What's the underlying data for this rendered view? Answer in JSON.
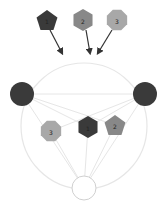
{
  "diagram": {
    "colors": {
      "dark": "#3a3a3a",
      "mid": "#888888",
      "light": "#a8a8a8",
      "edge": "#e6e6e6",
      "arrow": "#333333",
      "outline": "#d0d0d0"
    },
    "top_nodes": [
      {
        "id": "top-1",
        "shape": "pentagon",
        "label": "1",
        "cx": 47,
        "cy": 20,
        "color": "#3a3a3a"
      },
      {
        "id": "top-2",
        "shape": "hexagon",
        "label": "2",
        "cx": 83,
        "cy": 20,
        "color": "#888888"
      },
      {
        "id": "top-3",
        "shape": "octagon",
        "label": "3",
        "cx": 117,
        "cy": 20,
        "color": "#a8a8a8"
      }
    ],
    "arrows": [
      {
        "from": "top-1",
        "x1": 50,
        "y1": 30,
        "x2": 62,
        "y2": 53
      },
      {
        "from": "top-2",
        "x1": 86,
        "y1": 30,
        "x2": 90,
        "y2": 53
      },
      {
        "from": "top-3",
        "x1": 112,
        "y1": 30,
        "x2": 98,
        "y2": 53
      }
    ],
    "big_circle": {
      "cx": 84,
      "cy": 126,
      "r": 63
    },
    "side_nodes": [
      {
        "id": "left",
        "shape": "circle",
        "cx": 22,
        "cy": 94,
        "r": 12,
        "color": "#3a3a3a"
      },
      {
        "id": "right",
        "shape": "circle",
        "cx": 145,
        "cy": 94,
        "r": 12,
        "color": "#3a3a3a"
      }
    ],
    "inner_nodes": [
      {
        "id": "inner-3",
        "shape": "octagon",
        "label": "3",
        "cx": 51,
        "cy": 131,
        "color": "#a8a8a8"
      },
      {
        "id": "inner-1",
        "shape": "hexagon",
        "label": "1",
        "cx": 88,
        "cy": 127,
        "color": "#3a3a3a"
      },
      {
        "id": "inner-2",
        "shape": "pentagon",
        "label": "2",
        "cx": 115,
        "cy": 125,
        "color": "#888888"
      }
    ],
    "bottom_node": {
      "id": "bottom",
      "shape": "circle",
      "cx": 84,
      "cy": 188,
      "r": 12,
      "color": "#ffffff"
    }
  }
}
